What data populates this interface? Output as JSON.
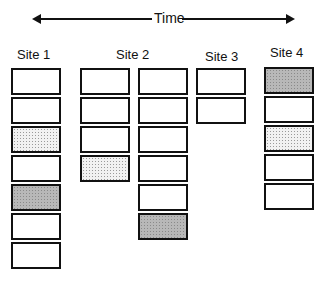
{
  "axis": {
    "label": "Time",
    "direction": "bidirectional"
  },
  "sites": [
    {
      "label": "Site 1",
      "columns": [
        [
          "empty",
          "empty",
          "dotted",
          "empty",
          "gray",
          "empty",
          "empty"
        ]
      ]
    },
    {
      "label": "Site 2",
      "columns": [
        [
          "empty",
          "empty",
          "empty",
          "dotted"
        ],
        [
          "empty",
          "empty",
          "empty",
          "empty",
          "empty",
          "gray"
        ]
      ]
    },
    {
      "label": "Site 3",
      "columns": [
        [
          "empty",
          "empty"
        ]
      ]
    },
    {
      "label": "Site 4",
      "columns": [
        [
          "gray",
          "empty",
          "dotted",
          "empty",
          "empty"
        ]
      ]
    }
  ],
  "fills": {
    "empty": "#ffffff",
    "dotted": "#e6e6e6",
    "gray": "#b0b0b0",
    "border": "#111111"
  }
}
